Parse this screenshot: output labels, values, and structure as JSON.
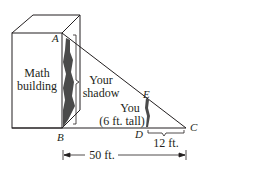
{
  "diagram": {
    "points": {
      "A": "A",
      "B": "B",
      "C": "C",
      "D": "D",
      "E": "E"
    },
    "labels": {
      "building_line1": "Math",
      "building_line2": "building",
      "shadow_line1": "Your",
      "shadow_line2": "shadow",
      "you_line1": "You",
      "you_line2": "(6 ft. tall)",
      "dc_length": "12 ft.",
      "bc_length": "50 ft."
    },
    "colors": {
      "line": "#231f20",
      "shadow": "#4a4a4a"
    }
  }
}
